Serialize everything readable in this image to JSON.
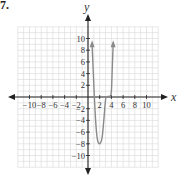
{
  "problem": {
    "label": "7."
  },
  "chart_data": {
    "type": "line",
    "title": "",
    "xlabel": "x",
    "ylabel": "y",
    "xlim": [
      -12,
      12
    ],
    "ylim": [
      -12,
      12
    ],
    "grid": true,
    "grid_step": 1,
    "x_tick_labels": [
      "-10",
      "-8",
      "-6",
      "-4",
      "-2",
      "2",
      "4",
      "6",
      "8",
      "10"
    ],
    "y_tick_labels": [
      "10",
      "8",
      "6",
      "4",
      "2",
      "-2",
      "-4",
      "-6",
      "-8",
      "-10"
    ],
    "series": [
      {
        "name": "polynomial",
        "color": "#8a8a8a",
        "x": [
          0.7,
          1.0,
          1.3,
          1.6,
          2.0,
          2.4,
          2.7,
          3.0,
          3.2,
          3.5,
          3.8,
          4.0,
          4.15,
          4.3
        ],
        "y": [
          9,
          2,
          -4,
          -7.2,
          -8,
          -7,
          -4,
          -0.5,
          0,
          0.1,
          0.2,
          1,
          5,
          9
        ],
        "end_arrows": [
          "start",
          "end"
        ]
      }
    ],
    "features": {
      "local_minimum": {
        "x": 2,
        "y": -8
      },
      "flat_region_near": {
        "x_from": 3,
        "x_to": 4,
        "y": 0
      }
    }
  },
  "colors": {
    "axis": "#222222",
    "grid": "#d6d6d6",
    "curve": "#8a8a8a"
  }
}
